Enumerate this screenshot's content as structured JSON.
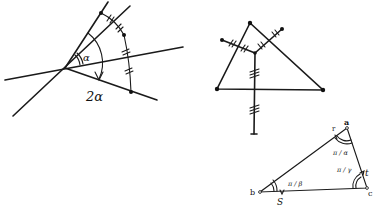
{
  "figures": [
    {
      "id": "angle-doubling",
      "description": "Reflection of a point across lines meeting at angle alpha produces rotation by 2 alpha",
      "labels": {
        "angle": "α",
        "double_angle": "2α"
      }
    },
    {
      "id": "perpendicular-bisectors",
      "description": "Triangle with perpendicular bisectors meeting at circumcenter, equal segments marked with tick marks",
      "labels": {}
    },
    {
      "id": "reflection-triangle",
      "description": "Triangle with vertices a, b, c and angles π/α, π/γ, π/β",
      "labels": {
        "vertex_a": "a",
        "vertex_b": "b",
        "vertex_c": "c",
        "point_r": "r",
        "point_s": "S",
        "point_t": "t",
        "angle_a": "π / α",
        "angle_c": "π / γ",
        "angle_b": "π / β"
      }
    }
  ],
  "colors": {
    "ink": "#1a1a1a",
    "background": "#ffffff"
  }
}
